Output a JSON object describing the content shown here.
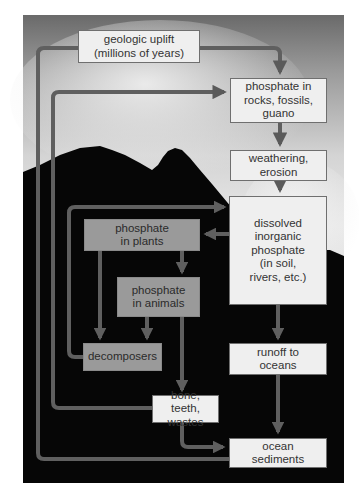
{
  "diagram": {
    "colors": {
      "arrow": "#5f5f5f",
      "light_box": "#efefef",
      "gray_box": "#9a9a9a",
      "background_dark": "#050505"
    },
    "nodes": {
      "geologic_uplift": "geologic uplift\n(millions of years)",
      "phosphate_rocks": "phosphate in\nrocks, fossils,\nguano",
      "weathering": "weathering,\nerosion",
      "dissolved": "dissolved\ninorganic\nphosphate\n(in soil,\nrivers, etc.)",
      "plants": "phosphate\nin plants",
      "animals": "phosphate\nin animals",
      "decomposers": "decomposers",
      "runoff": "runoff to\noceans",
      "bone": "bone, teeth,\nwastes",
      "ocean_sediments": "ocean\nsediments"
    },
    "edges": [
      {
        "from": "ocean_sediments",
        "to": "geologic_uplift"
      },
      {
        "from": "geologic_uplift",
        "to": "phosphate_rocks"
      },
      {
        "from": "bone",
        "to": "phosphate_rocks"
      },
      {
        "from": "phosphate_rocks",
        "to": "weathering"
      },
      {
        "from": "weathering",
        "to": "dissolved"
      },
      {
        "from": "dissolved",
        "to": "plants"
      },
      {
        "from": "plants",
        "to": "animals"
      },
      {
        "from": "plants",
        "to": "decomposers"
      },
      {
        "from": "animals",
        "to": "decomposers"
      },
      {
        "from": "animals",
        "to": "bone"
      },
      {
        "from": "decomposers",
        "to": "dissolved"
      },
      {
        "from": "dissolved",
        "to": "runoff"
      },
      {
        "from": "runoff",
        "to": "ocean_sediments"
      },
      {
        "from": "bone",
        "to": "ocean_sediments"
      }
    ]
  }
}
